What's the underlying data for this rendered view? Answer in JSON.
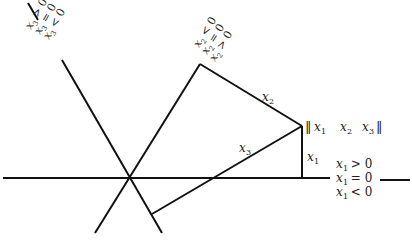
{
  "diagram": {
    "stroke_color": "#111111",
    "text_color": "#222222",
    "vector_label": {
      "open": "‖",
      "x1": "x",
      "x1_sub": "1",
      "x2": "x",
      "x2_sub": "2",
      "x3": "x",
      "x3_sub": "3",
      "close": "‖"
    },
    "edge_labels": {
      "x2": {
        "var": "x",
        "sub": "2"
      },
      "x3": {
        "var": "x",
        "sub": "3"
      },
      "x1": {
        "var": "x",
        "sub": "1"
      }
    },
    "x1_regions": [
      {
        "var": "x",
        "sub": "1",
        "rel": " > 0"
      },
      {
        "var": "x",
        "sub": "1",
        "rel": " = 0"
      },
      {
        "var": "x",
        "sub": "1",
        "rel": " < 0"
      }
    ],
    "x2_regions": [
      {
        "var": "x",
        "sub": "2",
        "rel": " < 0"
      },
      {
        "var": "x",
        "sub": "2",
        "rel": " = 0"
      },
      {
        "var": "x",
        "sub": "2",
        "rel": " > 0"
      }
    ],
    "x3_regions": [
      {
        "var": "x",
        "sub": "3",
        "rel": " > 0"
      },
      {
        "var": "x",
        "sub": "3",
        "rel": " = 0"
      },
      {
        "var": "x",
        "sub": "3",
        "rel": " < 0"
      }
    ]
  }
}
